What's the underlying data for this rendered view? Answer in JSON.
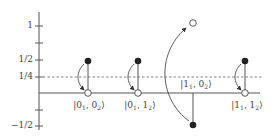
{
  "diagram": {
    "type": "energy-level transition diagram",
    "y_axis": {
      "ticks": [
        {
          "label": "1",
          "value": 1
        },
        {
          "label": "",
          "value": 0.75
        },
        {
          "label": "1/2",
          "value": 0.5
        },
        {
          "label": "1/4",
          "value": 0.25
        },
        {
          "label": "",
          "value": 0
        },
        {
          "label": "",
          "value": -0.25
        },
        {
          "label": "−1/2",
          "value": -0.5
        }
      ]
    },
    "reference_line": {
      "value": 0.25,
      "style": "dashed"
    },
    "states": [
      {
        "label_pre": "|0",
        "sub1": "1",
        "mid": ", 0",
        "sub2": "2",
        "post": "⟩",
        "from_value": 0.5,
        "to_value": 0
      },
      {
        "label_pre": "|0",
        "sub1": "1",
        "mid": ", 1",
        "sub2": "2",
        "post": "⟩",
        "from_value": 0.5,
        "to_value": 0
      },
      {
        "label_pre": "|1",
        "sub1": "1",
        "mid": ", 0",
        "sub2": "2",
        "post": "⟩",
        "from_value": -0.5,
        "to_value": 1.05
      },
      {
        "label_pre": "|1",
        "sub1": "1",
        "mid": ", 1",
        "sub2": "2",
        "post": "⟩",
        "from_value": 0.5,
        "to_value": 0
      }
    ],
    "legend": {
      "filled_circle": "initial",
      "open_circle": "final"
    },
    "colors": {
      "line": "#555555",
      "axis": "#555555",
      "dashed": "#666666",
      "dot": "#222222"
    }
  }
}
